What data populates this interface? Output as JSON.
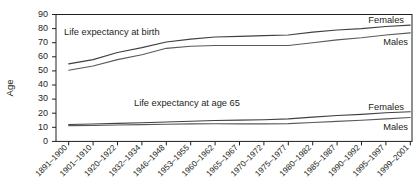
{
  "chart_data": {
    "type": "line",
    "title": "",
    "xlabel": "",
    "ylabel": "Age",
    "ylim": [
      0,
      90
    ],
    "ytick_step": 10,
    "grid": false,
    "legend_position": "inline-annotation",
    "categories": [
      "1891–1900",
      "1901–1910",
      "1920–1922",
      "1932–1934",
      "1946–1948",
      "1953–1955",
      "1960–1962",
      "1965–1967",
      "1970–1972",
      "1975–1977",
      "1980–1982",
      "1985–1987",
      "1990–1992",
      "1995–1997",
      "1999–2001"
    ],
    "yticks": [
      0,
      10,
      20,
      30,
      40,
      50,
      60,
      70,
      80,
      90
    ],
    "series": [
      {
        "name": "Females",
        "group": "Life expectancy at birth",
        "values": [
          55.0,
          58.0,
          63.0,
          66.5,
          70.5,
          72.5,
          74.0,
          74.5,
          75.0,
          75.5,
          77.5,
          79.0,
          80.0,
          81.5,
          82.5
        ]
      },
      {
        "name": "Males",
        "group": "Life expectancy at birth",
        "values": [
          50.5,
          53.5,
          58.0,
          61.5,
          66.0,
          67.5,
          68.0,
          68.0,
          68.0,
          68.0,
          70.0,
          72.0,
          73.5,
          75.5,
          77.0
        ]
      },
      {
        "name": "Females",
        "group": "Life expectancy at age 65",
        "values": [
          12.0,
          12.3,
          12.8,
          13.2,
          13.8,
          14.3,
          14.8,
          15.1,
          15.4,
          16.0,
          17.2,
          18.4,
          19.2,
          20.3,
          21.0
        ]
      },
      {
        "name": "Males",
        "group": "Life expectancy at age 65",
        "values": [
          11.2,
          11.3,
          11.6,
          11.9,
          12.2,
          12.4,
          12.5,
          12.4,
          12.4,
          12.6,
          13.4,
          14.2,
          15.0,
          16.0,
          17.0
        ]
      }
    ],
    "annotations": [
      {
        "id": "birth-group",
        "text": "Life expectancy at birth"
      },
      {
        "id": "age65-group",
        "text": "Life expectancy at age 65"
      },
      {
        "id": "birth-females",
        "text": "Females"
      },
      {
        "id": "birth-males",
        "text": "Males"
      },
      {
        "id": "age65-females",
        "text": "Females"
      },
      {
        "id": "age65-males",
        "text": "Males"
      }
    ]
  }
}
